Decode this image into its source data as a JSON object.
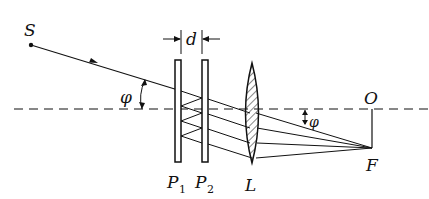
{
  "diagram": {
    "labels": {
      "source": "S",
      "separation": "d",
      "angle_left": "φ",
      "angle_right": "φ",
      "plate1_main": "P",
      "plate1_sub": "1",
      "plate2_main": "P",
      "plate2_sub": "2",
      "lens": "L",
      "origin": "O",
      "focus": "F"
    },
    "colors": {
      "ink": "#111111",
      "background": "#ffffff"
    }
  }
}
